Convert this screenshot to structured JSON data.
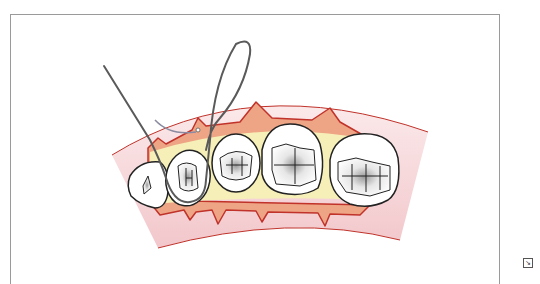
{
  "figure": {
    "teeth_count": 5,
    "colors": {
      "frame_border": "#9a9a9a",
      "gum_outer": "#f6d9dc",
      "gum_outline": "#c0322a",
      "papilla": "#eea585",
      "yellow_band": "#f6f0b8",
      "tooth_fill": "#ffffff",
      "tooth_outline": "#222222",
      "suture": "#5a5a5a"
    }
  },
  "corner_icon": {
    "name": "image-expand-icon",
    "glyph": "↘"
  }
}
